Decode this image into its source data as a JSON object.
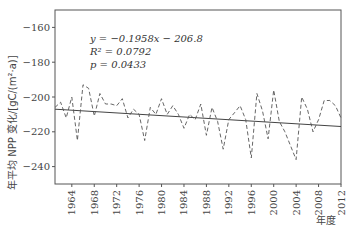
{
  "chart_data": {
    "type": "line",
    "title": "",
    "xlabel": "年度",
    "ylabel": "年平均 NPP 变化/[gC/(m²·a)]",
    "xlim": [
      1961,
      2012
    ],
    "ylim": [
      -250,
      -150
    ],
    "x_ticks": [
      1964,
      1968,
      1972,
      1976,
      1980,
      1984,
      1988,
      1992,
      1996,
      2000,
      2004,
      2008,
      2012
    ],
    "y_ticks": [
      -160,
      -180,
      -200,
      -220,
      -240
    ],
    "grid": false,
    "legend": null,
    "annotations": [
      "y = −0.1958x − 206.8",
      "R² = 0.0792",
      "p = 0.0433"
    ],
    "x": [
      1961,
      1962,
      1963,
      1964,
      1965,
      1966,
      1967,
      1968,
      1969,
      1970,
      1971,
      1972,
      1973,
      1974,
      1975,
      1976,
      1977,
      1978,
      1979,
      1980,
      1981,
      1982,
      1983,
      1984,
      1985,
      1986,
      1987,
      1988,
      1989,
      1990,
      1991,
      1992,
      1993,
      1994,
      1995,
      1996,
      1997,
      1998,
      1999,
      2000,
      2001,
      2002,
      2003,
      2004,
      2005,
      2006,
      2007,
      2008,
      2009,
      2010,
      2011,
      2012
    ],
    "series": [
      {
        "name": "年平均 NPP 变化",
        "style": "dashed",
        "values": [
          -206,
          -203,
          -212,
          -200,
          -225,
          -193,
          -195,
          -211,
          -198,
          -204,
          -204,
          -205,
          -201,
          -212,
          -207,
          -210,
          -225,
          -206,
          -210,
          -201,
          -210,
          -205,
          -210,
          -218,
          -210,
          -213,
          -204,
          -222,
          -206,
          -214,
          -230,
          -213,
          -209,
          -205,
          -213,
          -235,
          -198,
          -208,
          -224,
          -196,
          -214,
          -220,
          -228,
          -236,
          -200,
          -207,
          -220,
          -213,
          -202,
          -202,
          -205,
          -212
        ]
      },
      {
        "name": "线性趋势",
        "style": "solid",
        "slope": -0.1958,
        "intercept": -206.8
      }
    ]
  },
  "labels": {
    "equation": "y = −0.1958x − 206.8",
    "r2": "R² = 0.0792",
    "p": "p = 0.0433",
    "xlabel": "年度",
    "ylabel": "年平均 NPP 变化/[gC/(m²·a)]"
  }
}
